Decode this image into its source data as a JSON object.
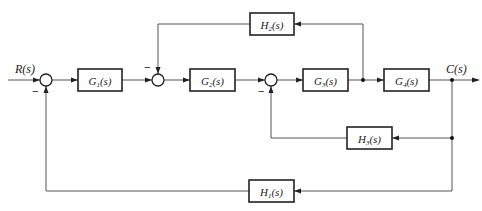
{
  "diagram": {
    "type": "block-diagram",
    "input": {
      "label": "R(s)"
    },
    "output": {
      "label": "C(s)"
    },
    "blocks": [
      {
        "id": "G1",
        "label_main": "G",
        "label_sub": "1",
        "label_tail": "(s)"
      },
      {
        "id": "G2",
        "label_main": "G",
        "label_sub": "2",
        "label_tail": "(s)"
      },
      {
        "id": "G3",
        "label_main": "G",
        "label_sub": "3",
        "label_tail": "(s)"
      },
      {
        "id": "G4",
        "label_main": "G",
        "label_sub": "4",
        "label_tail": "(s)"
      },
      {
        "id": "H2",
        "label_main": "H",
        "label_sub": "2",
        "label_tail": "(s)"
      },
      {
        "id": "H3",
        "label_main": "H",
        "label_sub": "3",
        "label_tail": "(s)"
      },
      {
        "id": "H1",
        "label_main": "H",
        "label_sub": "1",
        "label_tail": "(s)"
      }
    ],
    "summing_junctions": [
      {
        "id": "S1",
        "inputs": [
          "R(s)",
          "-H1(s)C(s)"
        ],
        "minus_sign": "−"
      },
      {
        "id": "S2",
        "inputs": [
          "G1 output",
          "-H2 output"
        ],
        "minus_sign": "−"
      },
      {
        "id": "S3",
        "inputs": [
          "G2 output",
          "-H3 output"
        ],
        "minus_sign": "−"
      }
    ],
    "connections": [
      "R(s) -> S1",
      "S1 -> G1",
      "G1 -> S2",
      "S2 -> G2",
      "G2 -> S3",
      "S3 -> G3",
      "G3 -> G4",
      "G4 -> C(s)",
      "G3 output -> H2 -> S2 (negative)",
      "C(s) -> H3 -> S3 (negative)",
      "C(s) -> H1 -> S1 (negative)"
    ]
  }
}
